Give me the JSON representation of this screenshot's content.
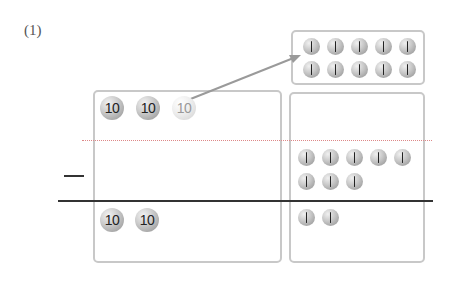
{
  "problem": {
    "label": "(1)",
    "operator": "−"
  },
  "coin_types": {
    "ten": {
      "face": "10",
      "value": 10
    },
    "one": {
      "face": "1",
      "value": 1
    }
  },
  "columns": {
    "tens": {
      "minuend_coins": [
        "10",
        "10",
        "10"
      ],
      "regrouped_coin_index": 2,
      "subtrahend_coins": [],
      "result_coins": [
        "10",
        "10"
      ]
    },
    "ones": {
      "exchanged_coins": [
        "1",
        "1",
        "1",
        "1",
        "1",
        "1",
        "1",
        "1",
        "1",
        "1"
      ],
      "subtrahend_coins": [
        "1",
        "1",
        "1",
        "1",
        "1",
        "1",
        "1",
        "1"
      ],
      "result_coins": [
        "1",
        "1"
      ]
    }
  },
  "annotations": {
    "arrow": "exchange one 10-coin for ten 1-coins",
    "colors": {
      "box_border": "#c8c8c8",
      "dotted_line": "#d88888",
      "arrow": "#999999",
      "rule_line": "#333333"
    }
  }
}
